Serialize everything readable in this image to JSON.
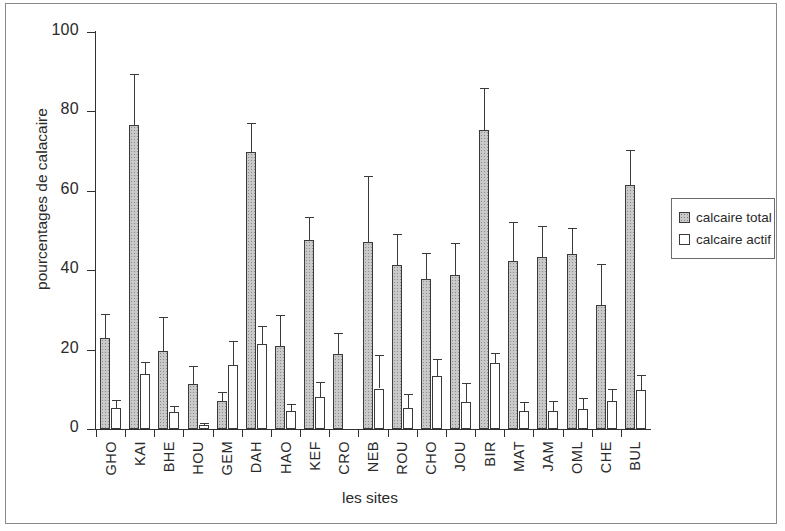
{
  "chart_data": {
    "type": "bar",
    "title": "",
    "xlabel": "les sites",
    "ylabel": "pourcentages de calacaire",
    "ylim": [
      0,
      100
    ],
    "yticks": [
      0,
      20,
      40,
      60,
      80,
      100
    ],
    "grid": false,
    "legend_position": "right",
    "error_bars": "yes",
    "categories": [
      "GHO",
      "KAI",
      "BHE",
      "HOU",
      "GEM",
      "DAH",
      "HAO",
      "KEF",
      "CRO",
      "NEB",
      "ROU",
      "CHO",
      "JOU",
      "BIR",
      "MAT",
      "JAM",
      "OML",
      "CHE",
      "BUL"
    ],
    "series": [
      {
        "name": "calcaire total",
        "color": "#c9c9c9",
        "values": [
          22.8,
          76.5,
          19.7,
          11.3,
          7.0,
          69.8,
          20.8,
          47.5,
          19.0,
          47.2,
          41.4,
          37.8,
          38.7,
          75.3,
          42.2,
          43.2,
          44.2,
          31.3,
          61.4
        ],
        "errors": [
          6.2,
          12.8,
          8.6,
          4.5,
          2.4,
          7.2,
          8.0,
          5.8,
          5.2,
          16.6,
          7.8,
          6.5,
          8.2,
          10.5,
          10.0,
          8.0,
          6.5,
          10.2,
          8.8
        ]
      },
      {
        "name": "calcaire actif",
        "color": "#ffffff",
        "values": [
          5.3,
          13.9,
          4.3,
          0.9,
          16.1,
          21.3,
          4.6,
          8.0,
          0.0,
          10.2,
          5.4,
          13.4,
          6.7,
          16.5,
          4.5,
          4.5,
          5.1,
          7.0,
          9.8
        ],
        "errors": [
          1.9,
          3.1,
          1.4,
          0.6,
          6.0,
          4.7,
          1.6,
          3.8,
          0.0,
          8.5,
          3.3,
          4.2,
          5.0,
          2.6,
          2.4,
          2.5,
          2.6,
          3.0,
          3.7
        ]
      }
    ]
  },
  "legend": {
    "items": [
      {
        "label": "calcaire total",
        "swatch": "total"
      },
      {
        "label": "calcaire actif",
        "swatch": "actif"
      }
    ]
  }
}
